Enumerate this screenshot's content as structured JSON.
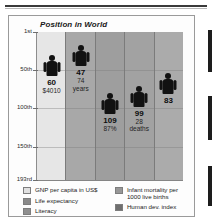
{
  "chart_data": {
    "type": "bar",
    "title": "Position in World",
    "xlabel": "",
    "ylabel": "Position in World",
    "grid": true,
    "legend_position": "bottom",
    "ylim": [
      1,
      193
    ],
    "ytick_labels": [
      "1st",
      "50th",
      "100th",
      "150th",
      "193rd"
    ],
    "ytick_values": [
      1,
      50,
      100,
      150,
      193
    ],
    "categories": [
      "GNP per capita in US$",
      "Life expectancy",
      "Literacy",
      "Infant mortality per 1000 live births",
      "Human dev. index"
    ],
    "values": [
      60,
      47,
      109,
      99,
      83
    ],
    "points": [
      {
        "category": "GNP per capita in US$",
        "rank": 60,
        "rank_label": "60",
        "value_label": "$4010",
        "value_unit": "",
        "column_color": "#e6e6e6"
      },
      {
        "category": "Life expectancy",
        "rank": 47,
        "rank_label": "47",
        "value_label": "74",
        "value_unit": "years",
        "column_color": "#a8a8a8"
      },
      {
        "category": "Literacy",
        "rank": 109,
        "rank_label": "109",
        "value_label": "87%",
        "value_unit": "",
        "column_color": "#9e9e9e"
      },
      {
        "category": "Infant mortality per 1000 live births",
        "rank": 99,
        "rank_label": "99",
        "value_label": "28",
        "value_unit": "deaths",
        "column_color": "#a2a2a2"
      },
      {
        "category": "Human dev. index",
        "rank": 83,
        "rank_label": "83",
        "value_label": "",
        "value_unit": "",
        "column_color": "#ababab"
      }
    ]
  },
  "legend": {
    "left": [
      {
        "label": "GNP per capita in US$",
        "color": "#e0e0e0"
      },
      {
        "label": "Life expectancy",
        "color": "#8a8a8a"
      },
      {
        "label": "Literacy",
        "color": "#8f8f8f"
      }
    ],
    "right": [
      {
        "label": "Infant mortality per 1000 live births",
        "color": "#979797"
      },
      {
        "label": "Human dev. index",
        "color": "#6f6f6f"
      }
    ]
  }
}
